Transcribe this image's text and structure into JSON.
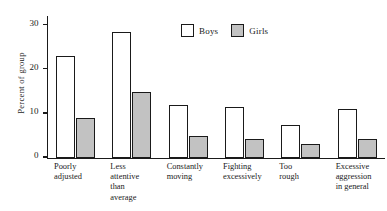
{
  "chart_data": {
    "type": "bar",
    "title": "",
    "xlabel": "",
    "ylabel": "Percent of group",
    "ylim": [
      0,
      32
    ],
    "yticks": [
      0,
      10,
      20,
      30
    ],
    "ytick_labels": [
      "0",
      "10",
      "20",
      "30"
    ],
    "grid": false,
    "legend_position": "top-center",
    "categories": [
      "Poorly\nadjusted",
      "Less\nattentive\nthan\naverage",
      "Constantly\nmoving",
      "Fighting\nexcessively",
      "Too\nrough",
      "Excessive\naggression\nin general"
    ],
    "series": [
      {
        "name": "Boys",
        "color": "#ffffff",
        "values": [
          23,
          28.5,
          12,
          11.5,
          7.5,
          11
        ]
      },
      {
        "name": "Girls",
        "color": "#c2c2c2",
        "values": [
          9,
          15,
          5,
          4.3,
          3,
          4.2
        ]
      }
    ]
  },
  "legend": {
    "items": [
      {
        "label": "Boys",
        "swatch": "white-square-icon"
      },
      {
        "label": "Girls",
        "swatch": "gray-square-icon"
      }
    ]
  }
}
